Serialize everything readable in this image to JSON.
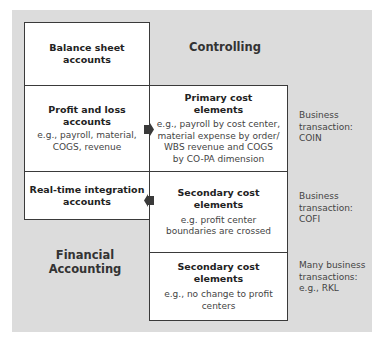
{
  "diagram": {
    "regions": {
      "controlling": "Controlling",
      "financial_accounting_line1": "Financial",
      "financial_accounting_line2": "Accounting"
    },
    "left_boxes": [
      {
        "title_line1": "Balance sheet",
        "title_line2": "accounts"
      },
      {
        "title_line1": "Profit and loss",
        "title_line2": "accounts",
        "desc_line1": "e.g., payroll, material,",
        "desc_line2": "COGS, revenue"
      },
      {
        "title_line1": "Real-time integration",
        "title_line2": "accounts"
      }
    ],
    "right_boxes": [
      {
        "title_line1": "Primary cost",
        "title_line2": "elements",
        "desc_lines": [
          "e.g., payroll by cost center,",
          "material expense by order/",
          "WBS revenue and COGS",
          "by CO-PA dimension"
        ]
      },
      {
        "title_line1": "Secondary cost",
        "title_line2": "elements",
        "desc_lines": [
          "e.g. profit center",
          "boundaries are crossed"
        ]
      },
      {
        "title_line1": "Secondary cost",
        "title_line2": "elements",
        "desc_lines": [
          "e.g., no change to profit",
          "centers"
        ]
      }
    ],
    "side_notes": [
      {
        "lines": [
          "Business",
          "transaction:",
          "COIN"
        ]
      },
      {
        "lines": [
          "Business",
          "transaction:",
          "COFI"
        ]
      },
      {
        "lines": [
          "Many business",
          "transactions:",
          "e.g., RKL"
        ]
      }
    ],
    "arrows": [
      {
        "from": "Profit and loss accounts",
        "to": "Primary cost elements",
        "direction": "right"
      },
      {
        "from": "Secondary cost elements",
        "to": "Real-time integration accounts",
        "direction": "left"
      }
    ]
  }
}
